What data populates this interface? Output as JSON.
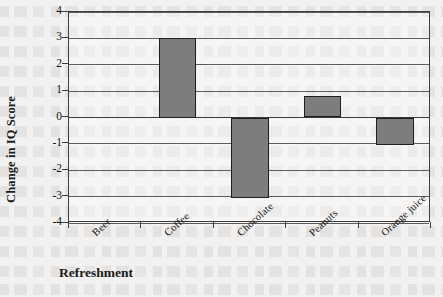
{
  "chart_data": {
    "type": "bar",
    "title": "",
    "subtitle": "",
    "xlabel": "Refreshment",
    "ylabel": "Change in IQ Score",
    "categories": [
      "Beer",
      "Coffee",
      "Chocolate",
      "Peanuts",
      "Orange juice"
    ],
    "values": [
      0,
      3.0,
      -3.05,
      0.8,
      -1.05
    ],
    "series": [
      {
        "name": "Change in IQ Score",
        "values": [
          0,
          3.0,
          -3.05,
          0.8,
          -1.05
        ]
      }
    ],
    "ylim": [
      -4,
      4
    ],
    "y_ticks": [
      4,
      3,
      2,
      1,
      0,
      -1,
      -2,
      -3,
      -4
    ],
    "y_tick_labels": [
      "4",
      "3",
      "2",
      "1",
      "0",
      "-1",
      "-2",
      "-3",
      "-4"
    ],
    "grid": true,
    "grid_axis": "y",
    "legend": false,
    "legend_position": "none",
    "bar_fill_color": "#7d7d7d",
    "bar_border_color": "#1e1e1e",
    "axis_color": "#3d3d3d",
    "gridline_color": "#5c5c5c",
    "background_color": "#f2f1ef",
    "category_label_rotation": -42
  },
  "axes": {
    "y_title": "Change in IQ Score",
    "x_title": "Refreshment"
  }
}
